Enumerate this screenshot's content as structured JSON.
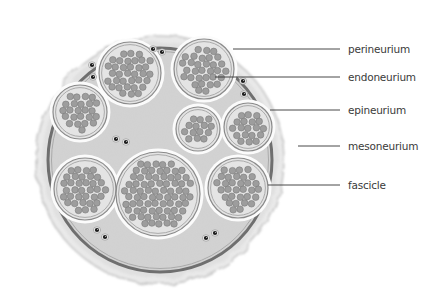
{
  "diagram": {
    "colors": {
      "background": "#ffffff",
      "epineurium_fill": "#d2d2d2",
      "mesoneurium": "#c8c8c8",
      "perineurium_ring": "#6f6f6f",
      "fascicle_fill": "#e4e4e4",
      "fascicle_ring": "#8a8a8a",
      "fiber_fill": "#9d9d9d",
      "fiber_ring": "#7a7a7a",
      "vessel": "#1e1e1e",
      "leader_line": "#333333",
      "label_text": "#3a3a3a"
    },
    "nerve": {
      "cx": 160,
      "cy": 160,
      "r_outer": 122,
      "r_ring": 112
    },
    "fascicles": [
      {
        "cx": 204,
        "cy": 69,
        "r": 30
      },
      {
        "cx": 130,
        "cy": 73,
        "r": 31
      },
      {
        "cx": 80,
        "cy": 112,
        "r": 27
      },
      {
        "cx": 248,
        "cy": 127,
        "r": 24
      },
      {
        "cx": 198,
        "cy": 129,
        "r": 22
      },
      {
        "cx": 85,
        "cy": 189,
        "r": 31
      },
      {
        "cx": 158,
        "cy": 194,
        "r": 42
      },
      {
        "cx": 238,
        "cy": 188,
        "r": 30
      }
    ],
    "vessels": [
      {
        "x": 153,
        "y": 49
      },
      {
        "x": 162,
        "y": 52
      },
      {
        "x": 92,
        "y": 65
      },
      {
        "x": 93,
        "y": 77
      },
      {
        "x": 243,
        "y": 81
      },
      {
        "x": 244,
        "y": 94
      },
      {
        "x": 116,
        "y": 139
      },
      {
        "x": 126,
        "y": 142
      },
      {
        "x": 97,
        "y": 230
      },
      {
        "x": 105,
        "y": 237
      },
      {
        "x": 206,
        "y": 238
      },
      {
        "x": 215,
        "y": 233
      }
    ],
    "labels": [
      {
        "id": "perineurium",
        "text": "perineurium",
        "y": 49,
        "line_x1": 233,
        "line_x2": 340
      },
      {
        "id": "endoneurium",
        "text": "endoneurium",
        "y": 77,
        "line_x1": 215,
        "line_x2": 340
      },
      {
        "id": "epineurium",
        "text": "epineurium",
        "y": 110,
        "line_x1": 270,
        "line_x2": 340
      },
      {
        "id": "mesoneurium",
        "text": "mesoneurium",
        "y": 146,
        "line_x1": 298,
        "line_x2": 340
      },
      {
        "id": "fascicle",
        "text": "fascicle",
        "y": 185,
        "line_x1": 268,
        "line_x2": 340
      }
    ]
  }
}
